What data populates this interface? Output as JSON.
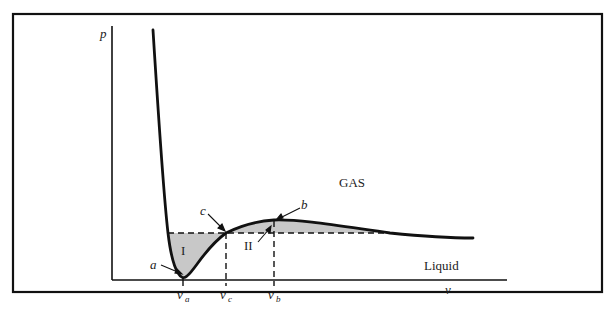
{
  "figure": {
    "type": "van der Waals isotherm p-v diagram with Maxwell equal-area construction",
    "y_axis_label": "p",
    "x_axis_label": "v",
    "region_gas_label": "GAS",
    "region_liquid_label": "Liquid",
    "area_labels": {
      "area_1": "I",
      "area_2": "II"
    },
    "points": {
      "a": "a",
      "b": "b",
      "c": "c"
    },
    "x_ticks": [
      {
        "main": "v",
        "sub": "a"
      },
      {
        "main": "v",
        "sub": "c"
      },
      {
        "main": "v",
        "sub": "b"
      }
    ],
    "colors": {
      "curve": "#111111",
      "shade": "#c8c8c8",
      "frame": "#111111"
    }
  }
}
